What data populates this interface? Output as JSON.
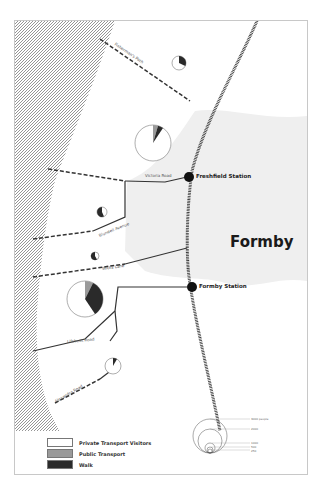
{
  "map": {
    "town_label": "Formby",
    "stations": [
      {
        "name": "Freshfield Station"
      },
      {
        "name": "Formby Station"
      }
    ],
    "roads": [
      {
        "name": "Fisherman's Path"
      },
      {
        "name": "Victoria Road"
      },
      {
        "name": "Blundell Avenue"
      },
      {
        "name": "Wicks Lane"
      },
      {
        "name": "Lifeboat Road"
      },
      {
        "name": "Alexandra Road"
      }
    ],
    "colors": {
      "private": "#ffffff",
      "public": "#9a9a9a",
      "walk": "#2a2a2a",
      "town_area": "#efefef",
      "coast_hatch": "#8a8a8a"
    }
  },
  "legend": {
    "items": [
      {
        "label": "Private Transport Visitors",
        "color": "#ffffff"
      },
      {
        "label": "Public Transport",
        "color": "#9a9a9a"
      },
      {
        "label": "Walk",
        "color": "#2a2a2a"
      }
    ],
    "scale": [
      "3000 people",
      "2000",
      "1000",
      "500",
      "250"
    ]
  }
}
